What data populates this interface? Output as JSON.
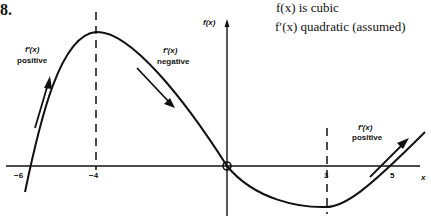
{
  "problem_number": "8.",
  "notes": {
    "line1": "f(x) is cubic",
    "line2": "f′(x) quadratic (assumed)"
  },
  "axes": {
    "y_label": "f(x)",
    "x_label": "x",
    "ticks": [
      {
        "value": -6,
        "label": "−6"
      },
      {
        "value": -4,
        "label": "−4"
      },
      {
        "value": 3,
        "label": "3"
      },
      {
        "value": 5,
        "label": "5"
      }
    ]
  },
  "annotations": {
    "left": {
      "line1": "f′(x)",
      "line2": "positive"
    },
    "middle": {
      "line1": "f′(x)",
      "line2": "negative"
    },
    "right": {
      "line1": "f′(x)",
      "line2": "positive"
    }
  },
  "features": {
    "maximum_x": -4,
    "minimum_x": 3,
    "origin_point_marked": true,
    "roots_x": [
      -6,
      0,
      5
    ]
  },
  "colors": {
    "ink": "#111111",
    "background": "#ffffff"
  }
}
